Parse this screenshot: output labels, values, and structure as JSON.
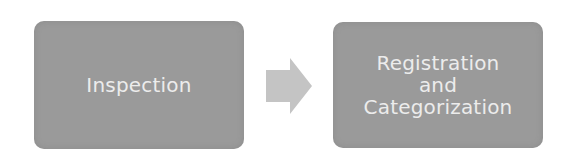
{
  "diagram": {
    "nodes": [
      {
        "id": "inspection",
        "label": "Inspection",
        "lines": [
          "Inspection"
        ]
      },
      {
        "id": "registration",
        "label": "Registration and Categorization",
        "lines": [
          "Registration",
          "and",
          "Categorization"
        ]
      }
    ],
    "edges": [
      {
        "from": "inspection",
        "to": "registration",
        "icon": "right-arrow-icon"
      }
    ],
    "colors": {
      "box_fill": "#9a9a9a",
      "text": "#ececec",
      "arrow": "#c4c4c4"
    }
  }
}
